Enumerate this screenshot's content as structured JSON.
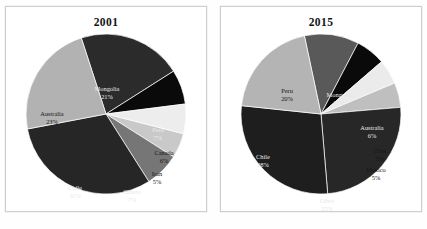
{
  "figure": {
    "panels": [
      {
        "panel_name": "pie-panel-2001",
        "title": "2001",
        "chart_index": 0
      },
      {
        "panel_name": "pie-panel-2015",
        "title": "2015",
        "chart_index": 1
      }
    ]
  },
  "chart_data": [
    {
      "type": "pie",
      "title": "2001",
      "xlabel": "",
      "ylabel": "",
      "legend": "none",
      "grid": false,
      "start_angle_deg": -18,
      "direction": "clockwise",
      "categories": [
        "Mongolia",
        "Peru",
        "Canada",
        "Iran",
        "Others",
        "Chile",
        "Australia"
      ],
      "values": [
        21,
        7,
        6,
        5,
        7,
        31,
        23
      ],
      "unit": "%",
      "labels": [
        {
          "name": "Mongolia",
          "pct": "21%",
          "color": "#2b2b2b",
          "text_color": "light",
          "lx": 101,
          "ly": 56
        },
        {
          "name": "Peru",
          "pct": "7%",
          "color": "#0a0a0a",
          "text_color": "light",
          "lx": 152,
          "ly": 97
        },
        {
          "name": "Canada",
          "pct": "6%",
          "color": "#ededed",
          "text_color": "dark",
          "lx": 158,
          "ly": 120
        },
        {
          "name": "Iran",
          "pct": "5%",
          "color": "#c9c9c9",
          "text_color": "dark",
          "lx": 151,
          "ly": 141
        },
        {
          "name": "Others",
          "pct": "7%",
          "color": "#767676",
          "text_color": "light",
          "lx": 126,
          "ly": 159
        },
        {
          "name": "Chile",
          "pct": "31%",
          "color": "#262626",
          "text_color": "light",
          "lx": 69,
          "ly": 155
        },
        {
          "name": "Australia",
          "pct": "23%",
          "color": "#b2b2b2",
          "text_color": "dark",
          "lx": 46,
          "ly": 81
        }
      ]
    },
    {
      "type": "pie",
      "title": "2015",
      "xlabel": "",
      "ylabel": "",
      "legend": "none",
      "grid": false,
      "start_angle_deg": -12,
      "direction": "clockwise",
      "categories": [
        "Mongolia",
        "Australia",
        "USA",
        "Mexico",
        "Other",
        "Chile",
        "Peru"
      ],
      "values": [
        11,
        6,
        5,
        5,
        25,
        28,
        20
      ],
      "unit": "%",
      "labels": [
        {
          "name": "Mongolia",
          "pct": "11%",
          "color": "#595959",
          "text_color": "light",
          "lx": 118,
          "ly": 62
        },
        {
          "name": "Australia",
          "pct": "6%",
          "color": "#0a0a0a",
          "text_color": "light",
          "lx": 151,
          "ly": 95
        },
        {
          "name": "USA",
          "pct": "5%",
          "color": "#ebebeb",
          "text_color": "dark",
          "lx": 159,
          "ly": 118
        },
        {
          "name": "Mexico",
          "pct": "5%",
          "color": "#bfbfbf",
          "text_color": "dark",
          "lx": 155,
          "ly": 137
        },
        {
          "name": "Other",
          "pct": "25%",
          "color": "#272727",
          "text_color": "light",
          "lx": 106,
          "ly": 168
        },
        {
          "name": "Chile",
          "pct": "28%",
          "color": "#1e1e1e",
          "text_color": "light",
          "lx": 42,
          "ly": 124
        },
        {
          "name": "Peru",
          "pct": "20%",
          "color": "#b4b4b4",
          "text_color": "dark",
          "lx": 66,
          "ly": 58
        }
      ]
    }
  ]
}
